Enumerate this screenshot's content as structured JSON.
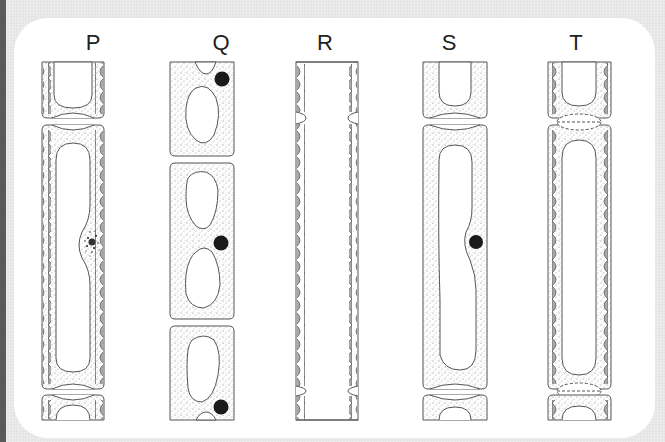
{
  "diagram": {
    "title": "",
    "columns": [
      {
        "id": "P",
        "label": "P",
        "center_x": 93,
        "description": "cells with wall thickenings, nucleus disintegrating, end walls intact"
      },
      {
        "id": "Q",
        "label": "Q",
        "center_x": 221,
        "description": "young cells with vacuoles and nuclei, no thickenings"
      },
      {
        "id": "R",
        "label": "R",
        "center_x": 325,
        "description": "continuous empty tube with wall thickenings, end walls gone"
      },
      {
        "id": "S",
        "label": "S",
        "center_x": 449,
        "description": "elongated cell with large vacuole and nucleus, no thickenings"
      },
      {
        "id": "T",
        "label": "T",
        "center_x": 576,
        "description": "thickened walls, end walls breaking down (dashed)"
      }
    ]
  },
  "colors": {
    "background": "#e4e4e4",
    "panel": "#ffffff",
    "outline": "#555555",
    "thickening": "#a9a9a9",
    "stipple": "#8a8a8a",
    "nucleus": "#1a1a1a",
    "edge_bar": "#5a5a5a"
  }
}
